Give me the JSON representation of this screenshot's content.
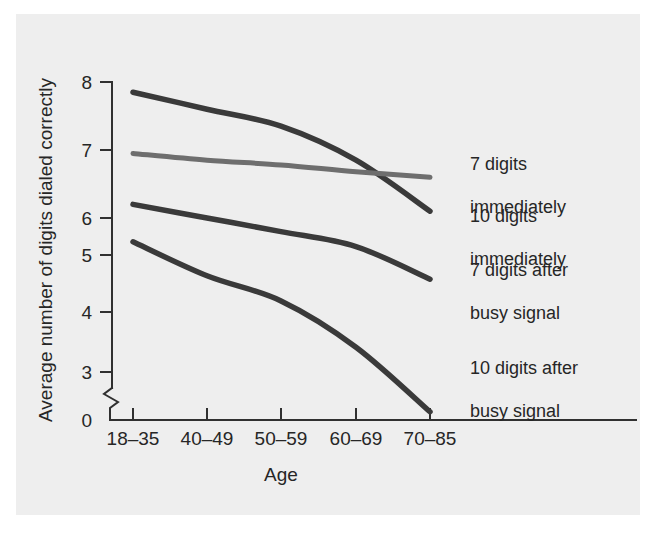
{
  "chart_data": {
    "type": "line",
    "title": "",
    "xlabel": "Age",
    "ylabel": "Average number of digits dialed correctly",
    "categories": [
      "18–35",
      "40–49",
      "50–59",
      "60–69",
      "70–85"
    ],
    "ytick_labels": [
      "0",
      "3",
      "4",
      "5",
      "6",
      "7",
      "8"
    ],
    "ylim": [
      3,
      8
    ],
    "y_axis_break": true,
    "grid": false,
    "legend_position": "right",
    "series": [
      {
        "name": "7 digits immediately",
        "color": "#3a3a3a",
        "values": [
          7.85,
          7.6,
          7.35,
          6.85,
          6.1
        ]
      },
      {
        "name": "10 digits immediately",
        "color": "#6e6e6e",
        "values": [
          6.95,
          6.85,
          6.78,
          6.68,
          6.6
        ]
      },
      {
        "name": "7 digits after busy signal",
        "color": "#3a3a3a",
        "values": [
          6.2,
          6.0,
          5.8,
          5.58,
          5.1
        ]
      },
      {
        "name": "10 digits after busy signal",
        "color": "#3a3a3a",
        "values": [
          5.65,
          5.15,
          4.78,
          4.1,
          3.15
        ]
      }
    ]
  },
  "legend": [
    {
      "line1": "7 digits",
      "line2": "immediately"
    },
    {
      "line1": "10 digits",
      "line2": "immediately"
    },
    {
      "line1": "7 digits after",
      "line2": "busy signal"
    },
    {
      "line1": "10 digits after",
      "line2": "busy signal"
    }
  ],
  "axis": {
    "x_title": "Age",
    "y_title": "Average number of digits dialed correctly"
  }
}
